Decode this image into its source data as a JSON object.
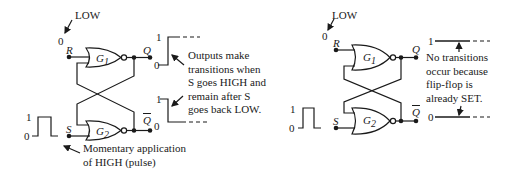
{
  "left_diagram": {
    "r_input_level_label": "LOW",
    "r_input_value": "0",
    "r_label": "R",
    "s_label": "S",
    "g1_label": "G",
    "g1_sub": "1",
    "g2_label": "G",
    "g2_sub": "2",
    "q_label": "Q",
    "qbar_label": "Q",
    "q_initial": "0",
    "qbar_initial": "0",
    "pulse_high": "1",
    "pulse_low": "0",
    "q_wave_high": "1",
    "q_wave_low": "0",
    "qbar_wave_high": "1",
    "annotation_outputs": [
      "Outputs make",
      "transitions when",
      "S goes HIGH and",
      "remain after S",
      "goes back LOW."
    ],
    "annotation_pulse": [
      "Momentary application",
      "of HIGH (pulse)"
    ]
  },
  "right_diagram": {
    "r_input_level_label": "LOW",
    "r_input_value": "0",
    "r_label": "R",
    "s_label": "S",
    "g1_label": "G",
    "g1_sub": "1",
    "g2_label": "G",
    "g2_sub": "2",
    "q_label": "Q",
    "qbar_label": "Q",
    "pulse_high": "1",
    "pulse_low": "0",
    "q_wave_level": "1",
    "qbar_wave_level": "0",
    "annotation": [
      "No transitions",
      "occur because",
      "flip-flop is",
      "already SET."
    ]
  }
}
